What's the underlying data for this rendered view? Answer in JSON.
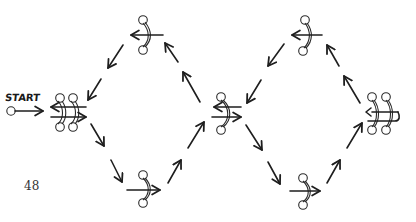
{
  "diagram": {
    "start_label": "START",
    "page_number": "48",
    "ink_color": "#1e1e1e",
    "background": "#ffffff",
    "nodes": [
      {
        "id": "start-point",
        "type": "start-circle",
        "x": 11,
        "y": 111
      },
      {
        "id": "left-double",
        "type": "double-figure",
        "x": 68,
        "y": 112
      },
      {
        "id": "top-left",
        "type": "single-figure",
        "x": 143,
        "y": 35,
        "arrow": "left"
      },
      {
        "id": "bottom-left",
        "type": "single-figure",
        "x": 143,
        "y": 190,
        "arrow": "right"
      },
      {
        "id": "center",
        "type": "single-figure",
        "x": 226,
        "y": 112,
        "arrow": "both"
      },
      {
        "id": "top-right",
        "type": "single-figure",
        "x": 297,
        "y": 35,
        "arrow": "left"
      },
      {
        "id": "bottom-right",
        "type": "single-figure",
        "x": 297,
        "y": 190,
        "arrow": "right"
      },
      {
        "id": "right-double",
        "type": "double-figure",
        "x": 383,
        "y": 112
      }
    ],
    "path_arrows": [
      {
        "from": "left-double",
        "to": "bottom-left",
        "direction": "down-right",
        "count": 2
      },
      {
        "from": "bottom-left",
        "to": "center",
        "direction": "up-right",
        "count": 2
      },
      {
        "from": "center",
        "to": "top-left",
        "direction": "up-left",
        "count": 2
      },
      {
        "from": "top-left",
        "to": "left-double",
        "direction": "down-left",
        "count": 2
      },
      {
        "from": "center",
        "to": "bottom-right",
        "direction": "down-right",
        "count": 2
      },
      {
        "from": "bottom-right",
        "to": "right-double",
        "direction": "up-right",
        "count": 2
      },
      {
        "from": "right-double",
        "to": "top-right",
        "direction": "up-left",
        "count": 2
      },
      {
        "from": "top-right",
        "to": "center",
        "direction": "down-left",
        "count": 2
      }
    ]
  }
}
